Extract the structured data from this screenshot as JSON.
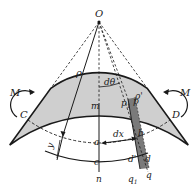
{
  "figure": {
    "colors": {
      "beam_fill": "#cfcfcf",
      "strip_fill": "#7a7a7a",
      "line": "#1a1a1a",
      "background": "#ffffff"
    },
    "labels": {
      "center": "O",
      "radius": "ρ",
      "angle": "dθ",
      "radius_prime": "ρ'",
      "moment_left": "M",
      "moment_right": "M",
      "point_C": "C",
      "point_D": "D",
      "point_m": "m",
      "point_n": "n",
      "point_p1": "p",
      "point_p1_sub": "1",
      "point_p": "p",
      "point_a": "a",
      "point_b": "b",
      "point_c": "c",
      "point_d_prime": "d'",
      "point_d": "d",
      "point_q1": "q",
      "point_q1_sub": "1",
      "point_q": "q",
      "dx": "dx",
      "y": "y"
    }
  }
}
